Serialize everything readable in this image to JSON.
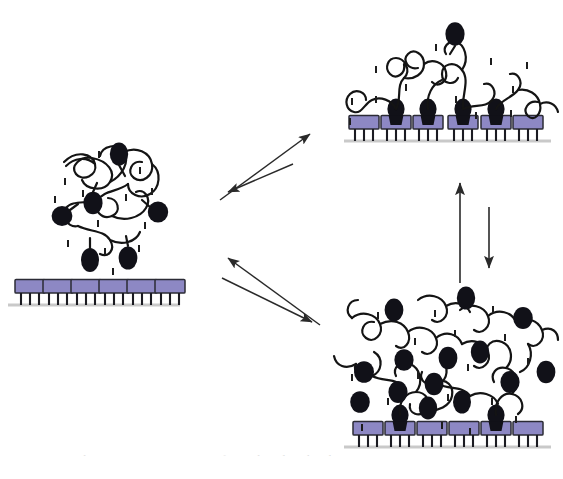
{
  "figure": {
    "caption": "Figure 17.  Schematic representation of a multivalent binding",
    "caption_clipped": true
  },
  "colors": {
    "receptor_fill": "#8d88c4",
    "receptor_stroke": "#2b2b35",
    "ligand_fill": "#111118",
    "chain_stroke": "#141414",
    "surface_line": "#c9c9c9",
    "arrow": "#2a2a2a",
    "tick_mark": "#1d1d1d",
    "background": "#ffffff"
  },
  "legend_semantics": {
    "receptor": "purple rectangle with three legs anchored to surface",
    "ligand": "black filled ellipse at polymer chain terminus",
    "polymer_chain": "black wavy random-coil line",
    "tick_mark": "short vertical dash representing solvent/ion",
    "surface": "horizontal gray substrate line"
  },
  "states": [
    {
      "id": "free-coil",
      "name": "unbound-polymer-state",
      "label": "",
      "receptors": 6,
      "receptors_bound": 0,
      "ligands": 6,
      "chains": 1,
      "description": "Free polymer coil in solution above an unoccupied receptor surface"
    },
    {
      "id": "dilute-bound",
      "name": "dilute-bound-state",
      "label": "",
      "receptors": 6,
      "receptors_bound": 4,
      "ligands": 5,
      "chains": 1,
      "description": "Single chain spread flat, multiple ligands bound to receptors"
    },
    {
      "id": "dense-brush",
      "name": "dense-adsorbed-state",
      "label": "",
      "receptors": 6,
      "receptors_bound": 2,
      "ligands": 14,
      "chains": 4,
      "description": "Crowded multi-chain layer, few ligands reach receptors"
    }
  ],
  "arrows": [
    {
      "id": "a1",
      "name": "arrow-free-to-dilute",
      "direction": "up-right",
      "label": ""
    },
    {
      "id": "a2",
      "name": "arrow-dilute-to-free",
      "direction": "down-left",
      "label": ""
    },
    {
      "id": "a3",
      "name": "arrow-free-to-dense",
      "direction": "down-right",
      "label": ""
    },
    {
      "id": "a4",
      "name": "arrow-dense-to-free",
      "direction": "up-left",
      "label": ""
    },
    {
      "id": "a5",
      "name": "arrow-dense-to-dilute",
      "direction": "up",
      "label": ""
    },
    {
      "id": "a6",
      "name": "arrow-dilute-to-dense",
      "direction": "down",
      "label": ""
    }
  ]
}
